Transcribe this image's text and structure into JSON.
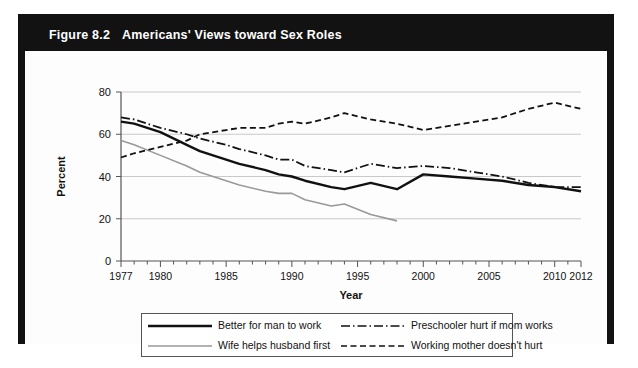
{
  "figure": {
    "label": "Figure 8.2",
    "title": "Americans' Views toward Sex Roles"
  },
  "chart_data": {
    "type": "line",
    "title": "Americans' Views toward Sex Roles",
    "xlabel": "Year",
    "ylabel": "Percent",
    "xlim": [
      1977,
      2012
    ],
    "ylim": [
      0,
      80
    ],
    "yticks": [
      0,
      20,
      40,
      60,
      80
    ],
    "xticks": [
      1977,
      1980,
      1985,
      1990,
      1995,
      2000,
      2005,
      2010,
      2012
    ],
    "grid": true,
    "legend_position": "bottom",
    "series": [
      {
        "name": "Better for man to work",
        "style": "solid",
        "color": "#111111",
        "width": 2.4,
        "x": [
          1977,
          1978,
          1980,
          1982,
          1983,
          1985,
          1986,
          1988,
          1989,
          1990,
          1991,
          1993,
          1994,
          1996,
          1998,
          2000,
          2002,
          2004,
          2006,
          2008,
          2010,
          2012
        ],
        "y": [
          66,
          65,
          61,
          55,
          52,
          48,
          46,
          43,
          41,
          40,
          38,
          35,
          34,
          37,
          34,
          41,
          40,
          39,
          38,
          36,
          35,
          33
        ]
      },
      {
        "name": "Wife helps husband first",
        "style": "solid",
        "color": "#999999",
        "width": 1.6,
        "x": [
          1977,
          1978,
          1980,
          1982,
          1983,
          1985,
          1986,
          1988,
          1989,
          1990,
          1991,
          1993,
          1994,
          1996,
          1998
        ],
        "y": [
          57,
          55,
          50,
          45,
          42,
          38,
          36,
          33,
          32,
          32,
          29,
          26,
          27,
          22,
          19
        ]
      },
      {
        "name": "Preschooler hurt if mom works",
        "style": "dashdot",
        "color": "#111111",
        "width": 1.8,
        "x": [
          1977,
          1978,
          1980,
          1982,
          1983,
          1985,
          1986,
          1988,
          1989,
          1990,
          1991,
          1993,
          1994,
          1996,
          1998,
          2000,
          2002,
          2004,
          2006,
          2008,
          2010,
          2012
        ],
        "y": [
          68,
          67,
          63,
          60,
          58,
          55,
          53,
          50,
          48,
          48,
          45,
          43,
          42,
          46,
          44,
          45,
          44,
          42,
          40,
          37,
          35,
          35
        ]
      },
      {
        "name": "Working mother doesn't hurt",
        "style": "dashed",
        "color": "#111111",
        "width": 1.8,
        "x": [
          1977,
          1978,
          1980,
          1982,
          1983,
          1985,
          1986,
          1988,
          1989,
          1990,
          1991,
          1993,
          1994,
          1996,
          1998,
          2000,
          2002,
          2004,
          2006,
          2008,
          2010,
          2012
        ],
        "y": [
          49,
          51,
          54,
          57,
          60,
          62,
          63,
          63,
          65,
          66,
          65,
          68,
          70,
          67,
          65,
          62,
          64,
          66,
          68,
          72,
          75,
          72
        ]
      }
    ]
  },
  "legend": {
    "items": [
      {
        "label": "Better for man to work",
        "style": "solid",
        "color": "#111111"
      },
      {
        "label": "Wife helps husband first",
        "style": "solid",
        "color": "#999999"
      },
      {
        "label": "Preschooler hurt if mom works",
        "style": "dashdot",
        "color": "#111111"
      },
      {
        "label": "Working mother doesn't hurt",
        "style": "dashed",
        "color": "#111111"
      }
    ]
  }
}
